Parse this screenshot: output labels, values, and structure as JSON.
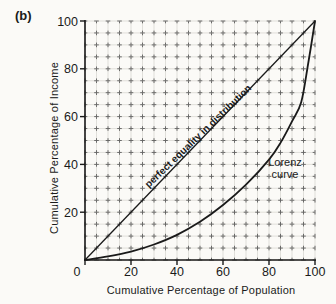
{
  "figure_label": "(b)",
  "colors": {
    "ink": "#1a1a1a",
    "paper": "#fbfaf7",
    "grid_light": "#cfccc6",
    "grid_cross": "#5d5d5d"
  },
  "chart_data": {
    "type": "line",
    "title": "",
    "xlabel": "Cumulative Percentage of Population",
    "ylabel": "Cumulative Percentage of Income",
    "xlim": [
      0,
      100
    ],
    "ylim": [
      0,
      100
    ],
    "x_ticks": [
      0,
      20,
      40,
      60,
      80,
      100
    ],
    "y_ticks": [
      20,
      40,
      60,
      80,
      100
    ],
    "grid": "minor grid every 5 units, dashed crosses at intersections",
    "legend_position": "none",
    "series": [
      {
        "name": "perfect equality in distribution",
        "shape": "straight-line",
        "points": [
          [
            0,
            0
          ],
          [
            100,
            100
          ]
        ]
      },
      {
        "name": "Lorenz curve",
        "shape": "convex-curve",
        "points": [
          [
            0,
            0
          ],
          [
            10,
            1.5
          ],
          [
            20,
            3.5
          ],
          [
            30,
            6.5
          ],
          [
            40,
            10.5
          ],
          [
            50,
            16
          ],
          [
            60,
            23
          ],
          [
            70,
            31.5
          ],
          [
            80,
            42
          ],
          [
            85,
            49
          ],
          [
            90,
            58
          ],
          [
            94,
            66
          ],
          [
            97,
            82
          ],
          [
            100,
            100
          ]
        ]
      }
    ],
    "annotations": [
      {
        "text": "perfect equality in distribution",
        "rotation_deg": -44,
        "placement": "along and just above the equality diagonal"
      },
      {
        "text": "Lorenz curve",
        "lines": [
          "Lorenz",
          "curve"
        ],
        "placement": "right of the curve bend near x=85, y=40"
      }
    ]
  }
}
